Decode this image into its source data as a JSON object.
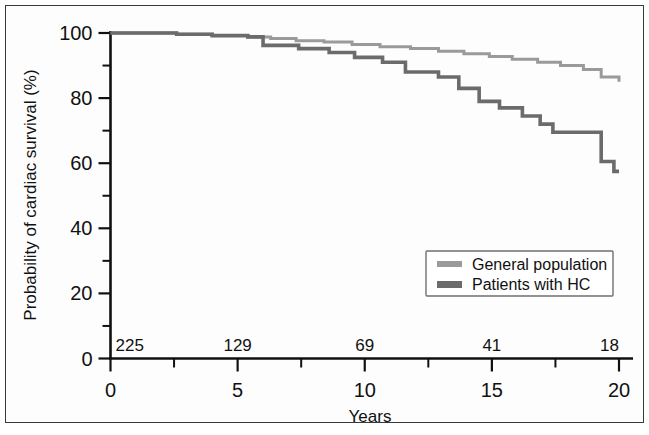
{
  "figure": {
    "background_color": "#ffffff",
    "frame_color": "#3a3a3a"
  },
  "chart_data": {
    "type": "line",
    "title": "",
    "subtitle": "",
    "xlabel": "Years",
    "ylabel": "Probability of cardiac survival (%)",
    "xlim": [
      0,
      20
    ],
    "ylim": [
      0,
      100
    ],
    "x_ticks": [
      0,
      5,
      10,
      15,
      20
    ],
    "x_tick_labels": [
      "0",
      "5",
      "10",
      "15",
      "20"
    ],
    "x_minor_ticks": [
      2.5,
      7.5,
      12.5,
      17.5
    ],
    "y_ticks": [
      0,
      20,
      40,
      60,
      80,
      100
    ],
    "y_tick_labels": [
      "0",
      "20",
      "40",
      "60",
      "80",
      "100"
    ],
    "y_minor_ticks": [
      10,
      30,
      50,
      70,
      90
    ],
    "grid": false,
    "legend_position": "lower right",
    "step_style": "post",
    "series": [
      {
        "name": "General population",
        "color": "#9a9a9a",
        "line_width": 3.0,
        "points": [
          [
            0.0,
            100.0
          ],
          [
            1.0,
            100.0
          ],
          [
            2.0,
            100.0
          ],
          [
            2.6,
            99.6
          ],
          [
            3.6,
            99.6
          ],
          [
            4.0,
            99.2
          ],
          [
            5.0,
            99.2
          ],
          [
            5.4,
            98.8
          ],
          [
            6.0,
            98.8
          ],
          [
            6.3,
            98.3
          ],
          [
            7.0,
            98.3
          ],
          [
            7.3,
            97.6
          ],
          [
            8.0,
            97.6
          ],
          [
            8.4,
            97.2
          ],
          [
            9.2,
            97.2
          ],
          [
            9.5,
            96.5
          ],
          [
            10.2,
            96.5
          ],
          [
            10.6,
            95.8
          ],
          [
            11.4,
            95.8
          ],
          [
            11.8,
            95.2
          ],
          [
            12.5,
            95.2
          ],
          [
            12.9,
            94.4
          ],
          [
            13.5,
            94.4
          ],
          [
            13.9,
            93.6
          ],
          [
            14.5,
            93.6
          ],
          [
            14.9,
            92.8
          ],
          [
            15.4,
            92.8
          ],
          [
            15.8,
            91.9
          ],
          [
            16.4,
            91.9
          ],
          [
            16.8,
            91.0
          ],
          [
            17.3,
            91.0
          ],
          [
            17.7,
            90.0
          ],
          [
            18.2,
            90.0
          ],
          [
            18.6,
            88.8
          ],
          [
            19.0,
            88.8
          ],
          [
            19.3,
            86.5
          ],
          [
            20.0,
            85.0
          ]
        ]
      },
      {
        "name": "Patients with HC",
        "color": "#6b6b6b",
        "line_width": 3.6,
        "points": [
          [
            0.0,
            100.0
          ],
          [
            1.0,
            100.0
          ],
          [
            2.0,
            100.0
          ],
          [
            2.6,
            99.6
          ],
          [
            3.6,
            99.6
          ],
          [
            4.0,
            99.2
          ],
          [
            5.0,
            99.2
          ],
          [
            5.4,
            98.8
          ],
          [
            5.9,
            98.8
          ],
          [
            6.0,
            96.2
          ],
          [
            7.2,
            96.2
          ],
          [
            7.4,
            95.2
          ],
          [
            8.4,
            95.2
          ],
          [
            8.6,
            94.0
          ],
          [
            9.4,
            94.0
          ],
          [
            9.6,
            92.5
          ],
          [
            10.4,
            92.5
          ],
          [
            10.7,
            91.0
          ],
          [
            11.4,
            91.0
          ],
          [
            11.6,
            88.0
          ],
          [
            12.6,
            88.0
          ],
          [
            12.9,
            86.5
          ],
          [
            13.4,
            86.5
          ],
          [
            13.7,
            83.0
          ],
          [
            14.2,
            83.0
          ],
          [
            14.5,
            79.0
          ],
          [
            15.0,
            79.0
          ],
          [
            15.3,
            77.0
          ],
          [
            15.9,
            77.0
          ],
          [
            16.2,
            74.5
          ],
          [
            16.6,
            74.5
          ],
          [
            16.9,
            72.0
          ],
          [
            17.2,
            72.0
          ],
          [
            17.4,
            69.5
          ],
          [
            19.0,
            69.5
          ],
          [
            19.3,
            60.5
          ],
          [
            19.6,
            60.5
          ],
          [
            19.8,
            57.5
          ],
          [
            20.0,
            57.5
          ]
        ]
      }
    ],
    "at_risk": {
      "label": "",
      "x_positions": [
        0,
        5,
        10,
        15,
        20
      ],
      "values": [
        "225",
        "129",
        "69",
        "41",
        "18"
      ]
    }
  },
  "legend": {
    "entries": [
      {
        "label": "General population",
        "color": "#9a9a9a"
      },
      {
        "label": "Patients with HC",
        "color": "#6b6b6b"
      }
    ]
  }
}
